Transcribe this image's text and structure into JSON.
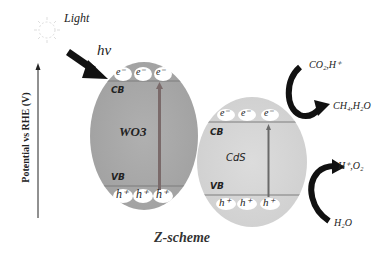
{
  "light": {
    "label": "Light",
    "photon": "hv"
  },
  "axis": {
    "label": "Potential vs RHE (V)"
  },
  "wo3": {
    "name": "WO3",
    "cb_label": "CB",
    "vb_label": "VB",
    "electrons": [
      "e⁻",
      "e⁻",
      "e⁻"
    ],
    "holes": [
      "h⁺",
      "h⁺",
      "h⁺"
    ],
    "fill": "#a9a9a9"
  },
  "cds": {
    "name": "CdS",
    "cb_label": "CB",
    "vb_label": "VB",
    "electrons": [
      "e⁻",
      "e⁻",
      "e⁻"
    ],
    "holes": [
      "h⁺",
      "h⁺",
      "h⁺"
    ],
    "fill": "#d6d6d6"
  },
  "reactions": {
    "reduction_in": "CO₂,H⁺",
    "reduction_out": "CH₄,H₂O",
    "oxidation_in": "H₂O",
    "oxidation_out": "H⁺,O₂"
  },
  "caption": "Z-scheme"
}
